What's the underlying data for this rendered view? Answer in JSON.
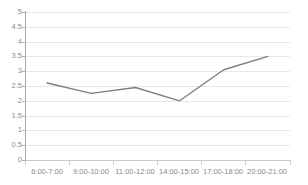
{
  "chart_data": {
    "type": "line",
    "title": "",
    "xlabel": "",
    "ylabel": "",
    "categories": [
      "6:00-7:00",
      "9:00-10:00",
      "11:00-12:00",
      "14:00-15:00",
      "17:00-18:00",
      "20:00-21:00"
    ],
    "series": [
      {
        "name": "",
        "values": [
          2.6,
          2.25,
          2.45,
          2.0,
          3.05,
          3.5
        ]
      }
    ],
    "ylim": [
      0,
      5
    ],
    "yticks": [
      "0",
      "0.5",
      "1",
      "1.5",
      "2",
      "2.5",
      "3",
      "3.5",
      "4",
      "4.5",
      "5"
    ],
    "ytick_values": [
      0,
      0.5,
      1,
      1.5,
      2,
      2.5,
      3,
      3.5,
      4,
      4.5,
      5
    ],
    "grid": true,
    "legend": "none",
    "line_color": "#7f7f7f",
    "grid_color": "#e8e8e8",
    "axis_color": "#aaaaaa",
    "tick_label_color": "#8a8a8a",
    "background_color": "#ffffff"
  }
}
